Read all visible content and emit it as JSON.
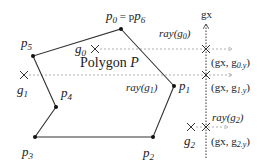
{
  "diagram": {
    "title": "Polygon P",
    "polygon_title_main": "Polygon ",
    "polygon_title_var": "P",
    "vertices": [
      {
        "id": "p0",
        "label": "p",
        "sub": "0",
        "extra": " = p",
        "extra_sub": "6",
        "x": 121,
        "y": 29
      },
      {
        "id": "p1",
        "label": "p",
        "sub": "1",
        "x": 174,
        "y": 86
      },
      {
        "id": "p2",
        "label": "p",
        "sub": "2",
        "x": 153,
        "y": 137
      },
      {
        "id": "p3",
        "label": "p",
        "sub": "3",
        "x": 35,
        "y": 137
      },
      {
        "id": "p4",
        "label": "p",
        "sub": "4",
        "x": 56,
        "y": 107
      },
      {
        "id": "p5",
        "label": "p",
        "sub": "5",
        "x": 33,
        "y": 56
      }
    ],
    "grid_line": {
      "label": "gx",
      "x": 206,
      "y_top": 22,
      "y_bottom": 158
    },
    "points": [
      {
        "id": "g0",
        "label": "g",
        "sub": "0",
        "x": 95,
        "y": 49,
        "ray_label": "ray(g0)",
        "ray_fn": "ray(",
        "ray_arg": "g",
        "ray_sub": "0",
        "ray_close": ")",
        "intersect_label_pre": "(gx, g",
        "intersect_sub": "0.y",
        "intersect_close": ")"
      },
      {
        "id": "g1",
        "label": "g",
        "sub": "1",
        "x": 24,
        "y": 75,
        "ray_label": "ray(g1)",
        "ray_fn": "ray(",
        "ray_arg": "g",
        "ray_sub": "1",
        "ray_close": ")",
        "intersect_label_pre": "(gx, g",
        "intersect_sub": "1.y",
        "intersect_close": ")"
      },
      {
        "id": "g2",
        "label": "g",
        "sub": "2",
        "x": 191,
        "y": 127,
        "ray_label": "ray(g2)",
        "ray_fn": "ray(",
        "ray_arg": "g",
        "ray_sub": "2",
        "ray_close": ")",
        "intersect_label_pre": "(gx, g",
        "intersect_sub": "2.y",
        "intersect_close": ")"
      }
    ],
    "colors": {
      "line": "#333333",
      "ray": "#9a9a9a",
      "text": "#222222"
    }
  }
}
